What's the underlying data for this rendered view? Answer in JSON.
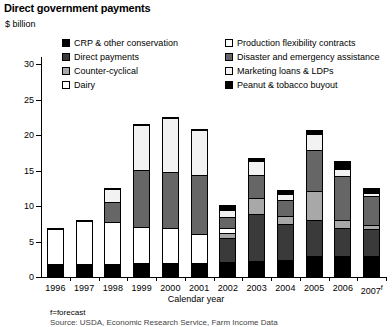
{
  "title": "Direct government payments",
  "y_axis_unit_label": "$ billion",
  "axis_title": "Calendar year",
  "footnote": "f=forecast",
  "source": "Source: USDA, Economic Research Service, Farm Income Data",
  "legend": {
    "column1": [
      {
        "label": "CRP & other conservation",
        "key": "crp",
        "swatch": "black-square-swatch"
      },
      {
        "label": "Direct payments",
        "key": "direct",
        "swatch": "dark-gray-square-swatch"
      },
      {
        "label": "Counter-cyclical",
        "key": "counter",
        "swatch": "medium-gray-square-swatch"
      },
      {
        "label": "Dairy",
        "key": "dairy",
        "swatch": "white-square-swatch"
      }
    ],
    "column2": [
      {
        "label": "Production flexibility contracts",
        "key": "pfc",
        "swatch": "white-square-swatch"
      },
      {
        "label": "Disaster and emergency assistance",
        "key": "disaster",
        "swatch": "gray-square-swatch"
      },
      {
        "label": "Marketing loans & LDPs",
        "key": "mlldp",
        "swatch": "dotted-square-swatch"
      },
      {
        "label": "Peanut & tobacco buyout",
        "key": "peanut",
        "swatch": "black-square-swatch"
      }
    ]
  },
  "chart_data": {
    "type": "bar",
    "stacked": true,
    "title": "Direct government payments",
    "xlabel": "Calendar year",
    "ylabel": "$ billion",
    "ylim": [
      0,
      31
    ],
    "yticks": [
      0,
      5,
      10,
      15,
      20,
      25,
      30
    ],
    "grid": false,
    "legend_position": "top",
    "categories": [
      "1996",
      "1997",
      "1998",
      "1999",
      "2000",
      "2001",
      "2002",
      "2003",
      "2004",
      "2005",
      "2006",
      "2007f"
    ],
    "series": [
      {
        "name": "CRP & other conservation",
        "key": "crp",
        "values": [
          1.8,
          1.7,
          1.8,
          1.9,
          1.9,
          1.9,
          2.0,
          2.2,
          2.3,
          2.8,
          2.9,
          2.9
        ]
      },
      {
        "name": "Production flexibility contracts",
        "key": "pfc",
        "values": [
          5.1,
          6.3,
          6.0,
          5.1,
          5.0,
          4.1,
          0.0,
          0.0,
          0.0,
          0.0,
          0.0,
          0.0
        ]
      },
      {
        "name": "Direct payments",
        "key": "direct",
        "values": [
          0.0,
          0.0,
          0.0,
          0.0,
          0.0,
          0.0,
          3.5,
          6.7,
          5.2,
          5.2,
          4.0,
          3.9
        ]
      },
      {
        "name": "Counter-cyclical",
        "key": "counter",
        "values": [
          0.0,
          0.0,
          0.0,
          0.0,
          0.0,
          0.0,
          0.8,
          2.3,
          1.1,
          4.1,
          1.2,
          0.6
        ]
      },
      {
        "name": "Dairy",
        "key": "dairy",
        "values": [
          0.0,
          0.0,
          0.0,
          0.0,
          0.0,
          0.0,
          0.7,
          0.0,
          0.0,
          0.0,
          0.0,
          0.0
        ]
      },
      {
        "name": "Disaster and emergency assistance",
        "key": "disaster",
        "values": [
          0.0,
          0.0,
          2.9,
          8.1,
          8.0,
          8.4,
          1.6,
          3.3,
          2.4,
          5.9,
          6.3,
          4.1
        ]
      },
      {
        "name": "Marketing loans & LDPs",
        "key": "mlldp",
        "values": [
          0.0,
          0.0,
          1.8,
          6.4,
          7.6,
          6.5,
          1.0,
          2.0,
          0.8,
          2.3,
          0.9,
          0.5
        ]
      },
      {
        "name": "Peanut & tobacco buyout",
        "key": "peanut",
        "values": [
          0.0,
          0.0,
          0.0,
          0.0,
          0.0,
          0.0,
          0.6,
          0.3,
          0.4,
          0.4,
          1.1,
          0.5
        ]
      }
    ],
    "totals": [
      6.9,
      8.0,
      12.5,
      21.5,
      22.5,
      20.9,
      10.2,
      16.8,
      12.2,
      20.7,
      16.4,
      12.5
    ]
  }
}
